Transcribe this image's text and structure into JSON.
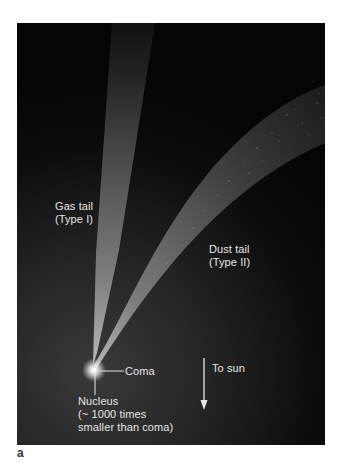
{
  "figure": {
    "panel_letter": "a",
    "colors": {
      "background_top": "#050505",
      "background_glow": "#333333",
      "tail": "#bdbdbd",
      "text": "#e6e6e6",
      "page": "#ffffff"
    }
  },
  "labels": {
    "gas_tail": {
      "line1": "Gas tail",
      "line2": "(Type I)"
    },
    "dust_tail": {
      "line1": "Dust tail",
      "line2": "(Type II)"
    },
    "coma": "Coma",
    "nucleus": {
      "line1": "Nucleus",
      "line2": "(~ 1000 times",
      "line3": "smaller than coma)"
    },
    "direction": "To sun"
  }
}
